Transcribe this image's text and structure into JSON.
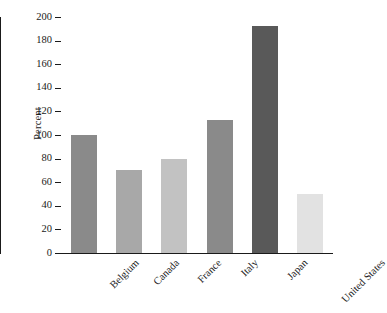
{
  "chart_data": {
    "type": "bar",
    "title": "",
    "subtitle": "",
    "xlabel": "",
    "ylabel": "Percent",
    "ylim": [
      0,
      200
    ],
    "ytick_step": 20,
    "yticks": [
      200,
      180,
      160,
      140,
      120,
      100,
      80,
      60,
      40,
      20,
      0
    ],
    "grid": false,
    "legend": null,
    "categories": [
      "Belgium",
      "Canada",
      "France",
      "Italy",
      "Japan",
      "United States"
    ],
    "values": [
      100,
      70,
      80,
      113,
      192,
      50
    ],
    "bar_colors": [
      "#8a8a8a",
      "#a8a8a8",
      "#c2c2c2",
      "#8a8a8a",
      "#595959",
      "#e2e2e2"
    ],
    "bars": [
      {
        "category": "Belgium",
        "value": 100,
        "color": "#8a8a8a"
      },
      {
        "category": "Canada",
        "value": 70,
        "color": "#a8a8a8"
      },
      {
        "category": "France",
        "value": 80,
        "color": "#c2c2c2"
      },
      {
        "category": "Italy",
        "value": 113,
        "color": "#8a8a8a"
      },
      {
        "category": "Japan",
        "value": 192,
        "color": "#595959"
      },
      {
        "category": "United States",
        "value": 50,
        "color": "#e2e2e2"
      }
    ]
  },
  "axis": {
    "line_color": "#1a1a1a",
    "tick_color": "#1a1a1a"
  }
}
